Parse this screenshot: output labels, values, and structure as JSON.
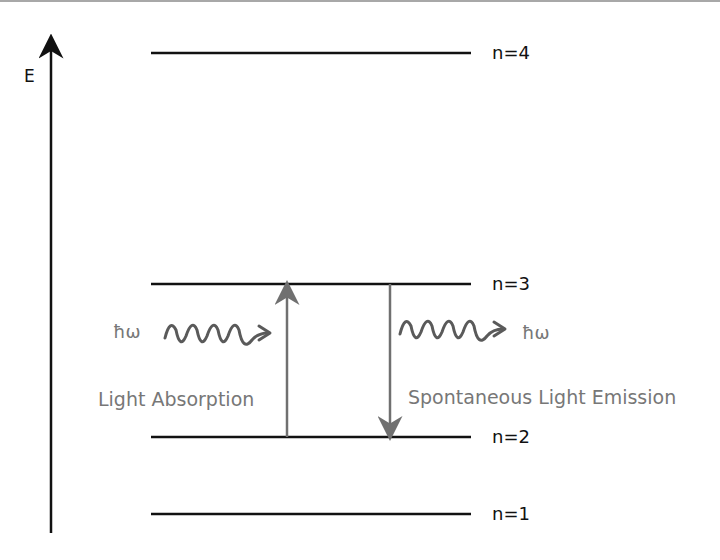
{
  "diagram": {
    "axis": {
      "label": "E",
      "direction": "up"
    },
    "levels": [
      {
        "name": "n=4",
        "y": 53
      },
      {
        "name": "n=3",
        "y": 284
      },
      {
        "name": "n=2",
        "y": 437
      },
      {
        "name": "n=1",
        "y": 514
      }
    ],
    "absorption": {
      "label": "Light Absorption",
      "photon_label": "ħω",
      "from": "n=2",
      "to": "n=3",
      "arrow_direction": "up"
    },
    "emission": {
      "label": "Spontaneous Light Emission",
      "photon_label": "ħω",
      "from": "n=3",
      "to": "n=2",
      "arrow_direction": "down"
    },
    "colors": {
      "level_line": "#111111",
      "transition_arrow": "#707070",
      "photon_wave": "#5a5a5a",
      "annotation_text": "#777777"
    }
  }
}
